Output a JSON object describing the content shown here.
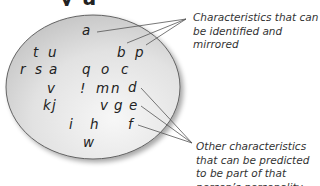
{
  "title_partial": "y  u",
  "ellipse": {
    "cx": 93,
    "cy": 87,
    "rx": 87,
    "ry": 72,
    "fill_light": "#f3f3f3",
    "fill_dark": "#c4c4c4",
    "stroke": "#555555"
  },
  "letters": [
    {
      "char": "a",
      "x": 82,
      "y": 24
    },
    {
      "char": "t",
      "x": 33,
      "y": 46
    },
    {
      "char": "u",
      "x": 48,
      "y": 46
    },
    {
      "char": "b",
      "x": 117,
      "y": 46
    },
    {
      "char": "p",
      "x": 135,
      "y": 46
    },
    {
      "char": "r",
      "x": 20,
      "y": 63
    },
    {
      "char": "s",
      "x": 35,
      "y": 63
    },
    {
      "char": "a",
      "x": 49,
      "y": 63
    },
    {
      "char": "q",
      "x": 82,
      "y": 63
    },
    {
      "char": "o",
      "x": 101,
      "y": 63
    },
    {
      "char": "c",
      "x": 121,
      "y": 63
    },
    {
      "char": "v",
      "x": 47,
      "y": 82
    },
    {
      "char": "!",
      "x": 80,
      "y": 82
    },
    {
      "char": "m",
      "x": 96,
      "y": 82
    },
    {
      "char": "n",
      "x": 111,
      "y": 82
    },
    {
      "char": "d",
      "x": 128,
      "y": 81
    },
    {
      "char": "k",
      "x": 43,
      "y": 99
    },
    {
      "char": "j",
      "x": 52,
      "y": 99
    },
    {
      "char": "v",
      "x": 100,
      "y": 99
    },
    {
      "char": "g",
      "x": 114,
      "y": 99
    },
    {
      "char": "e",
      "x": 129,
      "y": 99
    },
    {
      "char": "i",
      "x": 69,
      "y": 118
    },
    {
      "char": "h",
      "x": 90,
      "y": 118
    },
    {
      "char": "f",
      "x": 128,
      "y": 118
    },
    {
      "char": "w",
      "x": 83,
      "y": 136
    }
  ],
  "pointer_lines": {
    "top_convergence": {
      "x": 186,
      "y": 19
    },
    "top_sources": [
      {
        "letter": "a",
        "x": 97,
        "y": 32
      },
      {
        "letter": "b",
        "x": 127,
        "y": 43
      },
      {
        "letter": "p",
        "x": 146,
        "y": 45
      }
    ],
    "bottom_convergence": {
      "x": 192,
      "y": 143
    },
    "bottom_sources": [
      {
        "letter": "d",
        "x": 141,
        "y": 88
      },
      {
        "letter": "e",
        "x": 141,
        "y": 106
      },
      {
        "letter": "f",
        "x": 138,
        "y": 125
      }
    ],
    "color": "#555555"
  },
  "captions": {
    "top": "Characteristics that can be identified and mirrored",
    "bottom": "Other characteristics that can be predicted to be part of that person’s personality"
  }
}
